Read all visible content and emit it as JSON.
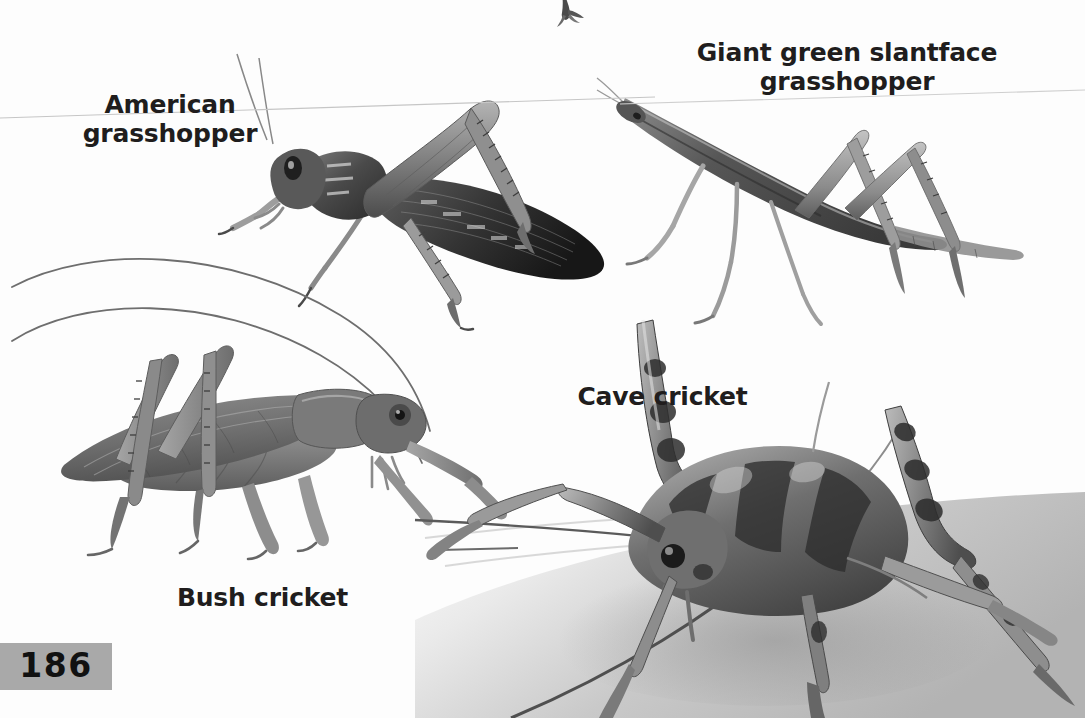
{
  "page": {
    "kind": "book-page-scan",
    "background_color": "#ffffff",
    "page_number": "186",
    "page_number_badge_color": "#a9a9a9",
    "label_color": "#201d1d"
  },
  "labels": {
    "american_grasshopper": "American\ngrasshopper",
    "giant_green_slantface_grasshopper": "Giant green slantface\ngrasshopper",
    "bush_cricket": "Bush cricket",
    "cave_cricket": "Cave cricket"
  },
  "figures": [
    {
      "name": "american-grasshopper",
      "label": "American grasshopper",
      "style": "grayscale stipple engraving illustration",
      "orientation": "side view facing left, long hind leg raised"
    },
    {
      "name": "giant-green-slantface-grasshopper",
      "label": "Giant green slantface grasshopper",
      "style": "grayscale pencil illustration",
      "orientation": "slender elongated body angled up to the left, long splayed legs"
    },
    {
      "name": "bush-cricket",
      "label": "Bush cricket",
      "style": "smooth grayscale airbrush illustration",
      "orientation": "side view facing right, two long antennae arcing up and left"
    },
    {
      "name": "cave-cricket",
      "label": "Cave cricket",
      "style": "grayscale photograph with soft shadowed ground",
      "orientation": "three-quarter front view, humped banded body, very long antennae and hind legs"
    },
    {
      "name": "top-edge-fragment",
      "label": "",
      "style": "cropped illustration fragment at top page edge",
      "orientation": "partial, cut off by page edge"
    }
  ]
}
